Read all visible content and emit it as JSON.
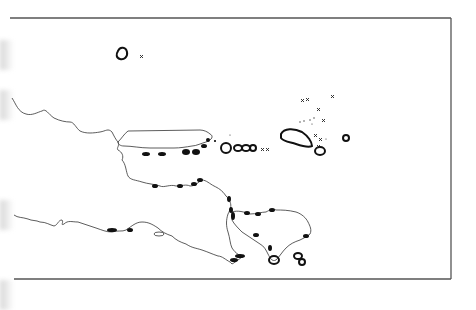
{
  "map": {
    "type": "coastline-outline-map",
    "region_depicted": "East Java, Madura and Bali coastlines with small islands",
    "frame": {
      "top": 18,
      "right": 451,
      "bottom": 279,
      "left_open": true,
      "stroke": "#555555"
    },
    "colors": {
      "background": "#ffffff",
      "coast": "#333333",
      "reef_marks": "#111111",
      "frame": "#555555"
    },
    "markers": {
      "symbol": "x",
      "count_visible": 12
    },
    "labels": []
  }
}
